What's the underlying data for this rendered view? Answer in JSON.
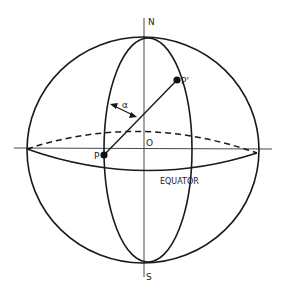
{
  "diagram": {
    "labels": {
      "north": "N",
      "south": "S",
      "origin": "O",
      "point_p": "P",
      "point_p_prime": "P'",
      "angle": "α",
      "equator": "EQUATOR"
    },
    "colors": {
      "stroke": "#1a1a1a",
      "background": "#ffffff"
    }
  }
}
